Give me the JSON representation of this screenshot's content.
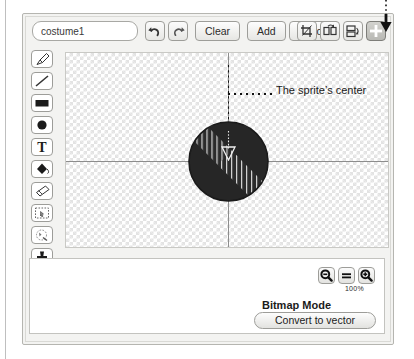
{
  "window": {
    "title": "Scratch Paint Editor"
  },
  "topbar": {
    "costume_name_value": "costume1",
    "costume_name_placeholder": "costume name",
    "undo_icon": "undo-arrow-icon",
    "redo_icon": "redo-arrow-icon",
    "clear_label": "Clear",
    "add_label": "Add",
    "import_label": "Import",
    "crop_icon": "crop-icon",
    "flip_horizontal_icon": "flip-horizontal-icon",
    "flip_vertical_icon": "flip-vertical-icon",
    "plus_icon": "plus-icon"
  },
  "tools": [
    {
      "name": "paintbrush-tool",
      "icon": "paintbrush-icon"
    },
    {
      "name": "line-tool",
      "icon": "line-icon"
    },
    {
      "name": "rectangle-tool",
      "icon": "rectangle-icon"
    },
    {
      "name": "ellipse-tool",
      "icon": "ellipse-icon"
    },
    {
      "name": "text-tool",
      "icon": "text-icon",
      "glyph": "T"
    },
    {
      "name": "fill-tool",
      "icon": "paint-bucket-icon"
    },
    {
      "name": "eraser-tool",
      "icon": "eraser-icon"
    },
    {
      "name": "select-tool",
      "icon": "select-rectangle-icon"
    },
    {
      "name": "reshape-tool",
      "icon": "magic-wand-icon"
    },
    {
      "name": "stamp-tool",
      "icon": "stamp-icon"
    }
  ],
  "canvas": {
    "background": "transparency-checkerboard",
    "crosshair_color": "#8d8d8d",
    "sprite": {
      "shape": "dark-circle-with-hatched-bands",
      "fill_color": "#2b2b2b",
      "hatch_color": "#d6d6d6",
      "center_marker": "triangle-crosshair-marker"
    },
    "annotation": {
      "label": "The sprite’s center",
      "leader_style": "dotted"
    }
  },
  "bottom_panel": {
    "zoom_out_icon": "zoom-out-magnifier-icon",
    "zoom_reset_icon": "equals-icon",
    "zoom_in_icon": "zoom-in-magnifier-icon",
    "zoom_percent": "100%",
    "mode_label": "Bitmap Mode",
    "convert_label": "Convert to vector"
  },
  "callout": {
    "arrow_icon": "down-arrow-callout-icon",
    "points_to": "plus-button"
  },
  "clipped_top_text": ""
}
